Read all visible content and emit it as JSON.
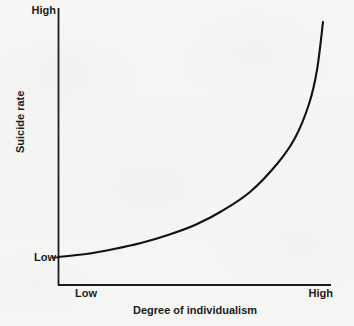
{
  "chart_data": {
    "type": "line",
    "title": "",
    "xlabel": "Degree of individualism",
    "ylabel": "Suicide rate",
    "x_tick_labels": [
      "Low",
      "High"
    ],
    "y_tick_labels": [
      "Low",
      "High"
    ],
    "xlim": [
      "Low",
      "High"
    ],
    "ylim": [
      "Low",
      "High"
    ],
    "grid": false,
    "legend": null,
    "annotations": [],
    "series": [
      {
        "name": "Suicide rate vs degree of individualism",
        "description": "Monotonically increasing, exponential-shaped curve rising from Low to High",
        "color": "#121212",
        "x": [
          0.0,
          0.1,
          0.2,
          0.3,
          0.4,
          0.5,
          0.6,
          0.7,
          0.8,
          0.88,
          0.94,
          1.0
        ],
        "y": [
          0.0,
          0.02,
          0.05,
          0.09,
          0.14,
          0.21,
          0.3,
          0.42,
          0.58,
          0.72,
          0.85,
          1.0
        ]
      }
    ],
    "curve_points_px": [
      [
        58,
        257
      ],
      [
        86,
        254
      ],
      [
        114,
        249
      ],
      [
        141,
        243
      ],
      [
        168,
        235
      ],
      [
        195,
        225
      ],
      [
        222,
        211
      ],
      [
        250,
        192
      ],
      [
        277,
        164
      ],
      [
        295,
        138
      ],
      [
        309,
        104
      ],
      [
        317,
        70
      ],
      [
        323,
        22
      ]
    ],
    "colors": {
      "background": "#f5f5f3",
      "axis": "#1c1c1c",
      "curve": "#121212",
      "text": "#1c1c1c"
    },
    "axes_px": {
      "y_axis_x": 58,
      "y_axis_top": 8,
      "y_axis_bottom": 285,
      "x_axis_y": 285,
      "x_axis_left": 58,
      "x_axis_right": 331,
      "y_low_tick_y": 257,
      "y_low_tick_left": 52
    }
  }
}
